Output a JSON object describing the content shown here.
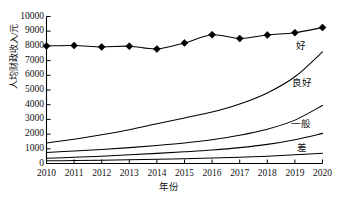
{
  "chart_data": {
    "type": "line",
    "title": "",
    "subtitle": "",
    "xlabel": "年份",
    "ylabel": "人均财政收入/元",
    "categories": [
      "2010",
      "2011",
      "2012",
      "2013",
      "2014",
      "2015",
      "2016",
      "2017",
      "2018",
      "2019",
      "2020"
    ],
    "x": [
      2010,
      2011,
      2012,
      2013,
      2014,
      2015,
      2016,
      2017,
      2018,
      2019,
      2020
    ],
    "xlim": [
      2010,
      2020
    ],
    "ylim": [
      0,
      10000
    ],
    "yticks": [
      0,
      1000,
      2000,
      3000,
      4000,
      5000,
      6000,
      7000,
      8000,
      9000,
      10000
    ],
    "ytick_labels": [
      "0",
      "1000",
      "2000",
      "3000",
      "4000",
      "5000",
      "6000",
      "7000",
      "8000",
      "9000",
      "10000"
    ],
    "grid": false,
    "legend_position": "inline-right",
    "series": [
      {
        "name": "人均财政收入",
        "label": "",
        "marker": "diamond",
        "values": [
          8000,
          8030,
          7930,
          7980,
          7790,
          8200,
          8760,
          8500,
          8740,
          8900,
          9250
        ]
      },
      {
        "name": "好",
        "label": "好",
        "marker": "none",
        "values": [
          1400,
          1650,
          1950,
          2300,
          2700,
          3100,
          3500,
          4050,
          4800,
          5900,
          7600
        ]
      },
      {
        "name": "良好",
        "label": "良好",
        "marker": "none",
        "values": [
          750,
          850,
          950,
          1080,
          1230,
          1400,
          1620,
          1920,
          2330,
          2950,
          3950
        ]
      },
      {
        "name": "一般",
        "label": "一般",
        "marker": "none",
        "values": [
          350,
          420,
          500,
          590,
          690,
          800,
          920,
          1080,
          1300,
          1620,
          2050
        ]
      },
      {
        "name": "差",
        "label": "差",
        "marker": "none",
        "values": [
          180,
          200,
          225,
          255,
          290,
          330,
          375,
          430,
          500,
          590,
          700
        ]
      }
    ],
    "annotations": [
      {
        "text": "好",
        "series": "好"
      },
      {
        "text": "良好",
        "series": "良好"
      },
      {
        "text": "一般",
        "series": "一般"
      },
      {
        "text": "差",
        "series": "差"
      }
    ],
    "colors": {
      "line": "#000000",
      "marker": "#000000",
      "axis": "#000000",
      "background": "#ffffff"
    }
  }
}
